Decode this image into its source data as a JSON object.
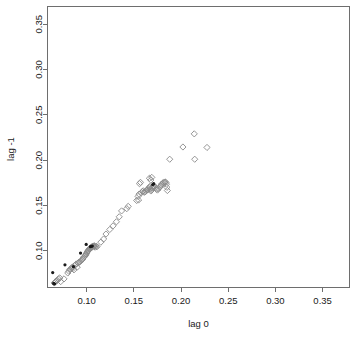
{
  "chart_data": {
    "type": "scatter",
    "title": "",
    "subtitle": "",
    "xlabel": "lag 0",
    "ylabel": "lag -1",
    "xlim": [
      0.0585,
      0.3785
    ],
    "ylim": [
      0.0595,
      0.3695
    ],
    "xticks": [
      0.1,
      0.15,
      0.2,
      0.25,
      0.3,
      0.35
    ],
    "yticks": [
      0.1,
      0.15,
      0.2,
      0.25,
      0.3,
      0.35
    ],
    "xtick_labels": [
      "0.10",
      "0.15",
      "0.20",
      "0.25",
      "0.30",
      "0.35"
    ],
    "ytick_labels": [
      "0.10",
      "0.15",
      "0.20",
      "0.25",
      "0.30",
      "0.35"
    ],
    "grid": false,
    "legend": null,
    "series": [
      {
        "name": "open-diamonds",
        "marker": "diamond-open",
        "color": "#8a8a8a",
        "points": [
          [
            0.0655,
            0.0645
          ],
          [
            0.0665,
            0.0655
          ],
          [
            0.0675,
            0.0665
          ],
          [
            0.069,
            0.0675
          ],
          [
            0.07,
            0.069
          ],
          [
            0.0715,
            0.07
          ],
          [
            0.0725,
            0.066
          ],
          [
            0.076,
            0.069
          ],
          [
            0.08,
            0.0755
          ],
          [
            0.081,
            0.0775
          ],
          [
            0.082,
            0.079
          ],
          [
            0.083,
            0.08
          ],
          [
            0.084,
            0.081
          ],
          [
            0.085,
            0.082
          ],
          [
            0.0855,
            0.0805
          ],
          [
            0.0865,
            0.079
          ],
          [
            0.087,
            0.0835
          ],
          [
            0.088,
            0.0845
          ],
          [
            0.089,
            0.0855
          ],
          [
            0.09,
            0.082
          ],
          [
            0.091,
            0.0865
          ],
          [
            0.092,
            0.0875
          ],
          [
            0.093,
            0.088
          ],
          [
            0.094,
            0.089
          ],
          [
            0.095,
            0.09
          ],
          [
            0.096,
            0.091
          ],
          [
            0.0965,
            0.0925
          ],
          [
            0.0975,
            0.0935
          ],
          [
            0.0985,
            0.0945
          ],
          [
            0.099,
            0.0955
          ],
          [
            0.0995,
            0.0965
          ],
          [
            0.1,
            0.0975
          ],
          [
            0.1005,
            0.0985
          ],
          [
            0.101,
            0.0995
          ],
          [
            0.1015,
            0.1
          ],
          [
            0.102,
            0.1005
          ],
          [
            0.1025,
            0.1015
          ],
          [
            0.103,
            0.102
          ],
          [
            0.1035,
            0.1025
          ],
          [
            0.104,
            0.103
          ],
          [
            0.1045,
            0.1035
          ],
          [
            0.105,
            0.104
          ],
          [
            0.1055,
            0.1042
          ],
          [
            0.106,
            0.1045
          ],
          [
            0.1065,
            0.1048
          ],
          [
            0.107,
            0.105
          ],
          [
            0.1075,
            0.1052
          ],
          [
            0.108,
            0.1055
          ],
          [
            0.1085,
            0.1048
          ],
          [
            0.109,
            0.104
          ],
          [
            0.11,
            0.105
          ],
          [
            0.111,
            0.1045
          ],
          [
            0.115,
            0.1095
          ],
          [
            0.118,
            0.113
          ],
          [
            0.1205,
            0.1185
          ],
          [
            0.1245,
            0.1235
          ],
          [
            0.128,
            0.1275
          ],
          [
            0.1315,
            0.132
          ],
          [
            0.1345,
            0.1375
          ],
          [
            0.137,
            0.144
          ],
          [
            0.1425,
            0.1465
          ],
          [
            0.144,
            0.149
          ],
          [
            0.153,
            0.1555
          ],
          [
            0.155,
            0.156
          ],
          [
            0.1545,
            0.16
          ],
          [
            0.1555,
            0.1625
          ],
          [
            0.158,
            0.164
          ],
          [
            0.159,
            0.1655
          ],
          [
            0.16,
            0.166
          ],
          [
            0.161,
            0.1645
          ],
          [
            0.162,
            0.165
          ],
          [
            0.163,
            0.1665
          ],
          [
            0.164,
            0.167
          ],
          [
            0.165,
            0.1675
          ],
          [
            0.1655,
            0.169
          ],
          [
            0.1665,
            0.17
          ],
          [
            0.167,
            0.171
          ],
          [
            0.1675,
            0.168
          ],
          [
            0.168,
            0.166
          ],
          [
            0.169,
            0.167
          ],
          [
            0.1695,
            0.169
          ],
          [
            0.17,
            0.17
          ],
          [
            0.1705,
            0.1715
          ],
          [
            0.171,
            0.172
          ],
          [
            0.172,
            0.171
          ],
          [
            0.173,
            0.1695
          ],
          [
            0.174,
            0.168
          ],
          [
            0.175,
            0.167
          ],
          [
            0.176,
            0.1685
          ],
          [
            0.1775,
            0.17
          ],
          [
            0.1785,
            0.1715
          ],
          [
            0.179,
            0.173
          ],
          [
            0.18,
            0.174
          ],
          [
            0.181,
            0.175
          ],
          [
            0.182,
            0.1755
          ],
          [
            0.183,
            0.176
          ],
          [
            0.184,
            0.1755
          ],
          [
            0.1845,
            0.1735
          ],
          [
            0.185,
            0.17
          ],
          [
            0.1855,
            0.1665
          ],
          [
            0.1665,
            0.18
          ],
          [
            0.168,
            0.178
          ],
          [
            0.169,
            0.181
          ],
          [
            0.156,
            0.174
          ],
          [
            0.157,
            0.1755
          ],
          [
            0.188,
            0.201
          ],
          [
            0.202,
            0.2145
          ],
          [
            0.214,
            0.229
          ],
          [
            0.2145,
            0.201
          ],
          [
            0.2275,
            0.214
          ]
        ]
      },
      {
        "name": "filled-dots",
        "marker": "dot-filled",
        "color": "#1a1a1a",
        "points": [
          [
            0.064,
            0.076
          ],
          [
            0.065,
            0.064
          ],
          [
            0.066,
            0.0635
          ],
          [
            0.077,
            0.0845
          ],
          [
            0.086,
            0.0825
          ],
          [
            0.0935,
            0.0975
          ],
          [
            0.0995,
            0.107
          ],
          [
            0.104,
            0.1045
          ],
          [
            0.105,
            0.105
          ],
          [
            0.106,
            0.1052
          ],
          [
            0.17,
            0.173
          ],
          [
            0.171,
            0.174
          ]
        ]
      }
    ]
  },
  "axes": {
    "x_title": "lag 0",
    "y_title": "lag -1"
  }
}
